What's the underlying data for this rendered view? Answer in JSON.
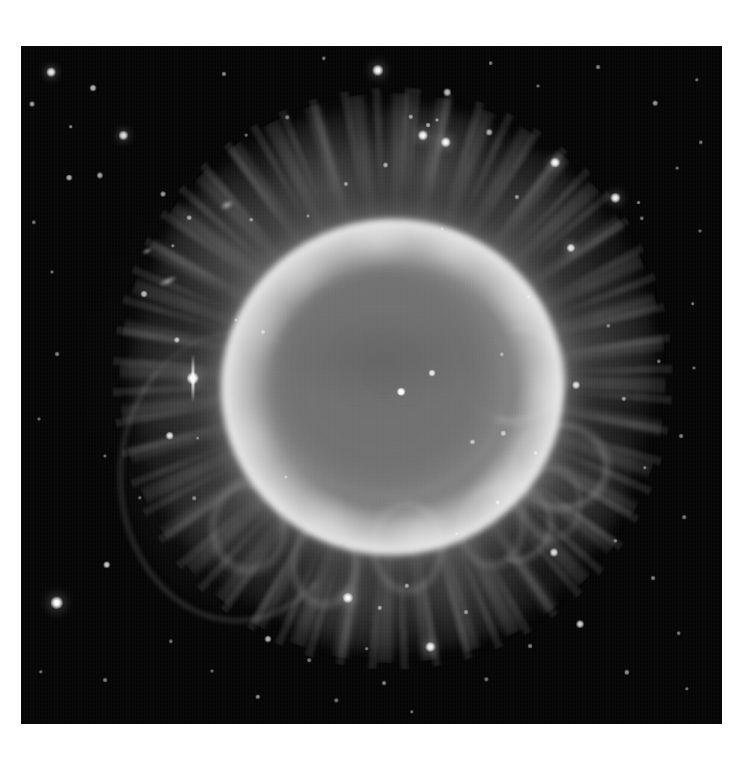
{
  "page": {
    "width": 754,
    "height": 771,
    "background_color": "#ffffff",
    "caption": ""
  },
  "plate": {
    "name": "planetary-nebula-plate",
    "left": 21,
    "top": 46,
    "width": 701,
    "height": 678,
    "border_color": "#ffffff",
    "sky_color": "#060606",
    "palette": "grayscale",
    "alt_text": "Grayscale telescope image of a planetary nebula: a bright elliptical ring surrounding a darker cavity with a central star, wrapped in a faint filamentary outer halo, set against a dense star field."
  },
  "nebula": {
    "type": "planetary-nebula",
    "ring": {
      "center_x_pct": 53.0,
      "center_y_pct": 50.3,
      "width_pct": 49.0,
      "height_pct": 49.5,
      "rotation_deg": -8,
      "peak_gray": "#f8f8f8",
      "inner_gray": "#c4c4c4"
    },
    "cavity": {
      "center_x_pct": 52.5,
      "center_y_pct": 49.5,
      "width_pct": 33.0,
      "height_pct": 33.0,
      "rotation_deg": -10,
      "gray": "#6c6c6c"
    },
    "halo": {
      "center_x_pct": 53.0,
      "center_y_pct": 49.0,
      "width_pct": 74.0,
      "height_pct": 80.0,
      "gray": "#969696",
      "structure": "radial filamentary petals with clumpy knots"
    },
    "arc_lower_left": {
      "center_x_pct": 30.5,
      "center_y_pct": 63.0,
      "width_pct": 33.0,
      "height_pct": 42.0,
      "gray": "#aaaaaa"
    }
  },
  "stars": [
    {
      "x": 4.3,
      "y": 3.9,
      "r": 3.6,
      "b": 0.9
    },
    {
      "x": 10.2,
      "y": 6.2,
      "r": 2.6,
      "b": 0.7
    },
    {
      "x": 1.6,
      "y": 8.5,
      "r": 2.2,
      "b": 0.62
    },
    {
      "x": 7.1,
      "y": 11.9,
      "r": 1.7,
      "b": 0.52
    },
    {
      "x": 14.6,
      "y": 13.2,
      "r": 3.4,
      "b": 0.85
    },
    {
      "x": 6.9,
      "y": 19.4,
      "r": 2.5,
      "b": 0.68
    },
    {
      "x": 11.3,
      "y": 19.1,
      "r": 2.3,
      "b": 0.64
    },
    {
      "x": 20.2,
      "y": 21.9,
      "r": 2.2,
      "b": 0.6
    },
    {
      "x": 24.0,
      "y": 25.3,
      "r": 2.1,
      "b": 0.58
    },
    {
      "x": 28.9,
      "y": 4.1,
      "r": 1.9,
      "b": 0.54
    },
    {
      "x": 32.1,
      "y": 13.2,
      "r": 1.4,
      "b": 0.42
    },
    {
      "x": 38.0,
      "y": 10.5,
      "r": 1.6,
      "b": 0.46
    },
    {
      "x": 43.2,
      "y": 1.8,
      "r": 1.6,
      "b": 0.46
    },
    {
      "x": 50.9,
      "y": 3.6,
      "r": 4.2,
      "b": 0.95
    },
    {
      "x": 55.6,
      "y": 10.4,
      "r": 2.0,
      "b": 0.56
    },
    {
      "x": 60.8,
      "y": 6.8,
      "r": 2.8,
      "b": 0.72
    },
    {
      "x": 67.0,
      "y": 2.5,
      "r": 1.7,
      "b": 0.48
    },
    {
      "x": 73.8,
      "y": 5.9,
      "r": 1.5,
      "b": 0.44
    },
    {
      "x": 82.3,
      "y": 3.1,
      "r": 1.8,
      "b": 0.5
    },
    {
      "x": 90.5,
      "y": 8.4,
      "r": 2.1,
      "b": 0.58
    },
    {
      "x": 96.4,
      "y": 5.0,
      "r": 1.6,
      "b": 0.45
    },
    {
      "x": 57.3,
      "y": 13.2,
      "r": 3.8,
      "b": 0.95
    },
    {
      "x": 60.6,
      "y": 14.2,
      "r": 3.9,
      "b": 0.96
    },
    {
      "x": 58.1,
      "y": 11.6,
      "r": 1.8,
      "b": 0.62
    },
    {
      "x": 59.4,
      "y": 10.9,
      "r": 1.5,
      "b": 0.55
    },
    {
      "x": 52.0,
      "y": 17.5,
      "r": 2.2,
      "b": 0.62
    },
    {
      "x": 46.4,
      "y": 20.3,
      "r": 1.9,
      "b": 0.52
    },
    {
      "x": 66.8,
      "y": 12.7,
      "r": 2.4,
      "b": 0.64
    },
    {
      "x": 76.2,
      "y": 17.2,
      "r": 4.0,
      "b": 0.94
    },
    {
      "x": 84.8,
      "y": 22.4,
      "r": 3.8,
      "b": 0.92
    },
    {
      "x": 88.1,
      "y": 23.1,
      "r": 1.8,
      "b": 0.52
    },
    {
      "x": 88.6,
      "y": 25.4,
      "r": 1.6,
      "b": 0.46
    },
    {
      "x": 70.7,
      "y": 22.2,
      "r": 1.9,
      "b": 0.52
    },
    {
      "x": 93.6,
      "y": 18.0,
      "r": 1.4,
      "b": 0.42
    },
    {
      "x": 97.0,
      "y": 14.2,
      "r": 1.6,
      "b": 0.46
    },
    {
      "x": 96.8,
      "y": 27.3,
      "r": 1.5,
      "b": 0.42
    },
    {
      "x": 1.8,
      "y": 26.0,
      "r": 1.6,
      "b": 0.46
    },
    {
      "x": 4.4,
      "y": 33.4,
      "r": 1.5,
      "b": 0.44
    },
    {
      "x": 17.6,
      "y": 36.6,
      "r": 2.6,
      "b": 0.7
    },
    {
      "x": 21.7,
      "y": 29.5,
      "r": 1.6,
      "b": 0.46
    },
    {
      "x": 32.8,
      "y": 25.6,
      "r": 1.7,
      "b": 0.48
    },
    {
      "x": 41.0,
      "y": 25.0,
      "r": 1.5,
      "b": 0.44
    },
    {
      "x": 24.5,
      "y": 49.0,
      "r": 4.6,
      "b": 1.0
    },
    {
      "x": 22.2,
      "y": 43.4,
      "r": 2.3,
      "b": 0.7
    },
    {
      "x": 21.2,
      "y": 57.5,
      "r": 3.2,
      "b": 0.86
    },
    {
      "x": 25.2,
      "y": 57.8,
      "r": 1.4,
      "b": 0.42
    },
    {
      "x": 5.2,
      "y": 45.5,
      "r": 1.8,
      "b": 0.5
    },
    {
      "x": 2.6,
      "y": 55.0,
      "r": 1.5,
      "b": 0.42
    },
    {
      "x": 12.0,
      "y": 60.5,
      "r": 1.5,
      "b": 0.42
    },
    {
      "x": 17.0,
      "y": 66.6,
      "r": 1.6,
      "b": 0.44
    },
    {
      "x": 24.7,
      "y": 66.7,
      "r": 1.7,
      "b": 0.46
    },
    {
      "x": 5.1,
      "y": 82.1,
      "r": 5.0,
      "b": 1.0
    },
    {
      "x": 12.2,
      "y": 76.5,
      "r": 2.8,
      "b": 0.78
    },
    {
      "x": 2.8,
      "y": 92.3,
      "r": 1.6,
      "b": 0.44
    },
    {
      "x": 12.0,
      "y": 93.5,
      "r": 1.8,
      "b": 0.48
    },
    {
      "x": 21.4,
      "y": 87.8,
      "r": 1.6,
      "b": 0.44
    },
    {
      "x": 27.3,
      "y": 92.2,
      "r": 1.5,
      "b": 0.42
    },
    {
      "x": 33.8,
      "y": 96.0,
      "r": 2.0,
      "b": 0.54
    },
    {
      "x": 35.2,
      "y": 87.5,
      "r": 2.6,
      "b": 0.7
    },
    {
      "x": 41.1,
      "y": 90.6,
      "r": 1.7,
      "b": 0.46
    },
    {
      "x": 45.0,
      "y": 96.5,
      "r": 1.6,
      "b": 0.44
    },
    {
      "x": 51.8,
      "y": 94.0,
      "r": 1.8,
      "b": 0.5
    },
    {
      "x": 55.8,
      "y": 98.2,
      "r": 1.6,
      "b": 0.44
    },
    {
      "x": 58.4,
      "y": 88.6,
      "r": 3.8,
      "b": 0.92
    },
    {
      "x": 46.6,
      "y": 81.4,
      "r": 4.2,
      "b": 0.96
    },
    {
      "x": 51.2,
      "y": 82.9,
      "r": 2.0,
      "b": 0.58
    },
    {
      "x": 55.0,
      "y": 79.6,
      "r": 2.0,
      "b": 0.56
    },
    {
      "x": 49.3,
      "y": 88.9,
      "r": 1.7,
      "b": 0.46
    },
    {
      "x": 63.5,
      "y": 83.5,
      "r": 1.8,
      "b": 0.5
    },
    {
      "x": 66.4,
      "y": 93.4,
      "r": 1.6,
      "b": 0.44
    },
    {
      "x": 72.6,
      "y": 88.5,
      "r": 1.8,
      "b": 0.5
    },
    {
      "x": 79.8,
      "y": 85.3,
      "r": 2.9,
      "b": 0.8
    },
    {
      "x": 86.4,
      "y": 92.4,
      "r": 2.0,
      "b": 0.56
    },
    {
      "x": 93.8,
      "y": 86.6,
      "r": 1.7,
      "b": 0.46
    },
    {
      "x": 95.0,
      "y": 94.8,
      "r": 1.6,
      "b": 0.44
    },
    {
      "x": 76.0,
      "y": 74.7,
      "r": 3.0,
      "b": 0.82
    },
    {
      "x": 84.8,
      "y": 73.0,
      "r": 1.6,
      "b": 0.44
    },
    {
      "x": 90.2,
      "y": 78.5,
      "r": 1.8,
      "b": 0.48
    },
    {
      "x": 94.6,
      "y": 69.5,
      "r": 1.7,
      "b": 0.46
    },
    {
      "x": 89.0,
      "y": 62.2,
      "r": 1.6,
      "b": 0.44
    },
    {
      "x": 94.2,
      "y": 57.5,
      "r": 1.8,
      "b": 0.48
    },
    {
      "x": 86.0,
      "y": 52.0,
      "r": 2.0,
      "b": 0.54
    },
    {
      "x": 91.0,
      "y": 46.5,
      "r": 1.6,
      "b": 0.44
    },
    {
      "x": 79.2,
      "y": 50.0,
      "r": 2.9,
      "b": 0.82
    },
    {
      "x": 83.8,
      "y": 41.3,
      "r": 1.6,
      "b": 0.44
    },
    {
      "x": 95.8,
      "y": 38.0,
      "r": 1.7,
      "b": 0.46
    },
    {
      "x": 96.0,
      "y": 47.5,
      "r": 1.5,
      "b": 0.42
    },
    {
      "x": 72.4,
      "y": 37.0,
      "r": 1.7,
      "b": 0.48
    },
    {
      "x": 68.6,
      "y": 45.5,
      "r": 1.6,
      "b": 0.44
    },
    {
      "x": 73.4,
      "y": 60.0,
      "r": 1.8,
      "b": 0.5
    },
    {
      "x": 68.0,
      "y": 67.3,
      "r": 2.0,
      "b": 0.54
    },
    {
      "x": 62.2,
      "y": 72.0,
      "r": 1.6,
      "b": 0.44
    },
    {
      "x": 78.5,
      "y": 29.8,
      "r": 3.4,
      "b": 0.88
    },
    {
      "x": 60.0,
      "y": 27.0,
      "r": 1.5,
      "b": 0.42
    },
    {
      "x": 54.2,
      "y": 51.0,
      "r": 3.2,
      "b": 0.95
    },
    {
      "x": 58.6,
      "y": 48.3,
      "r": 2.6,
      "b": 0.88
    },
    {
      "x": 64.4,
      "y": 58.4,
      "r": 1.9,
      "b": 0.58
    },
    {
      "x": 68.8,
      "y": 57.1,
      "r": 2.0,
      "b": 0.6
    },
    {
      "x": 34.5,
      "y": 42.2,
      "r": 1.8,
      "b": 0.5
    },
    {
      "x": 30.6,
      "y": 40.4,
      "r": 1.5,
      "b": 0.42
    },
    {
      "x": 37.8,
      "y": 63.6,
      "r": 1.5,
      "b": 0.42
    }
  ],
  "diffraction_star": {
    "name": "bright-star-with-diffraction-spike",
    "x_pct": 24.5,
    "y_pct": 49.0,
    "spike_length_pct": 7.0,
    "spike_width_px": 3
  },
  "central_star": {
    "name": "central-star",
    "x_pct": 54.2,
    "y_pct": 51.0,
    "note": "white dwarf at nebula center"
  },
  "galaxies": [
    {
      "x": 29.4,
      "y": 23.4,
      "w": 14,
      "h": 8,
      "rot": -28
    },
    {
      "x": 20.9,
      "y": 34.6,
      "w": 18,
      "h": 7,
      "rot": -24
    },
    {
      "x": 18.0,
      "y": 30.2,
      "w": 10,
      "h": 5,
      "rot": -30
    }
  ]
}
